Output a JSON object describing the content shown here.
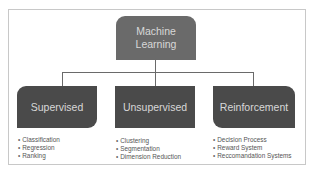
{
  "diagram": {
    "root": {
      "label": "Machine\nLearning",
      "color": "#6a6a6a"
    },
    "branches": [
      {
        "label": "Supervised",
        "color": "#4a4a4a",
        "items": [
          "Classification",
          "Regression",
          "Ranking"
        ]
      },
      {
        "label": "Unsupervised",
        "color": "#4a4a4a",
        "items": [
          "Clustering",
          "Segmentation",
          "Dimension Reduction"
        ]
      },
      {
        "label": "Reinforcement",
        "color": "#4a4a4a",
        "items": [
          "Decision Process",
          "Reward System",
          "Reccomandation Systems"
        ]
      }
    ],
    "bullet": "•"
  }
}
